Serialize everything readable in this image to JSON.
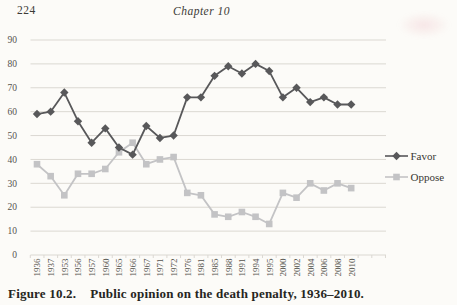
{
  "page": {
    "page_number": "224",
    "running_header": "Chapter 10",
    "caption_label": "Figure 10.2.",
    "caption_text": "Public opinion on the death penalty, 1936–2010."
  },
  "chart_data": {
    "type": "line",
    "title": "",
    "xlabel": "",
    "ylabel": "",
    "categories": [
      "1936",
      "1937",
      "1953",
      "1956",
      "1957",
      "1960",
      "1965",
      "1966",
      "1967",
      "1971",
      "1972",
      "1976",
      "1981",
      "1985",
      "1988",
      "1991",
      "1994",
      "1995",
      "2000",
      "2002",
      "2004",
      "2006",
      "2008",
      "2010"
    ],
    "series": [
      {
        "name": "Favor",
        "marker": "diamond",
        "color": "#58585a",
        "values": [
          59,
          60,
          68,
          56,
          47,
          53,
          45,
          42,
          54,
          49,
          50,
          66,
          66,
          75,
          79,
          76,
          80,
          77,
          66,
          70,
          64,
          66,
          63,
          63
        ]
      },
      {
        "name": "Oppose",
        "marker": "square",
        "color": "#c3c3c5",
        "values": [
          38,
          33,
          25,
          34,
          34,
          36,
          43,
          47,
          38,
          40,
          41,
          26,
          25,
          17,
          16,
          18,
          16,
          13,
          26,
          24,
          30,
          27,
          30,
          28
        ]
      }
    ],
    "ylim": [
      0,
      90
    ],
    "ytick_step": 10,
    "grid": true,
    "legend_position": "right",
    "grid_color": "#dbd8d2",
    "axis_label_color": "#55534e",
    "legend_text_color": "#3a3834"
  }
}
